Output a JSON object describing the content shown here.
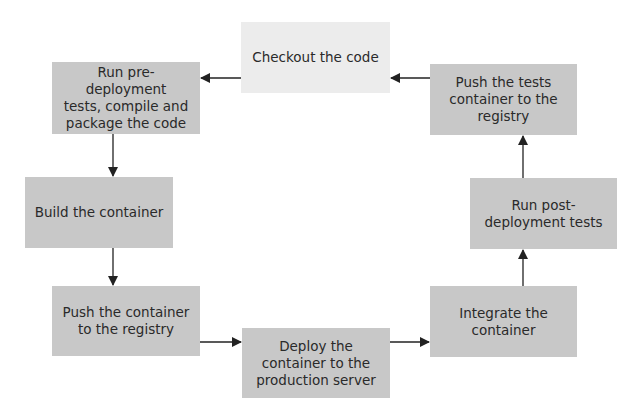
{
  "diagram": {
    "type": "flowchart-cycle",
    "colors": {
      "box": "#c8c8c8",
      "start_box": "#ececec",
      "text": "#2a2a2a",
      "arrow": "#222222"
    },
    "nodes": [
      {
        "id": "checkout",
        "label": "Checkout the code"
      },
      {
        "id": "pre_tests",
        "label": "Run pre-deployment\ntests, compile and\npackage the code"
      },
      {
        "id": "build",
        "label": "Build the container"
      },
      {
        "id": "push_container",
        "label": "Push the container\nto the registry"
      },
      {
        "id": "deploy",
        "label": "Deploy the\ncontainer to the\nproduction server"
      },
      {
        "id": "integrate",
        "label": "Integrate the\ncontainer"
      },
      {
        "id": "post_tests",
        "label": "Run post-\ndeployment tests"
      },
      {
        "id": "push_tests",
        "label": "Push the tests\ncontainer to the\nregistry"
      }
    ],
    "edges": [
      [
        "checkout",
        "pre_tests"
      ],
      [
        "pre_tests",
        "build"
      ],
      [
        "build",
        "push_container"
      ],
      [
        "push_container",
        "deploy"
      ],
      [
        "deploy",
        "integrate"
      ],
      [
        "integrate",
        "post_tests"
      ],
      [
        "post_tests",
        "push_tests"
      ],
      [
        "push_tests",
        "checkout"
      ]
    ]
  }
}
